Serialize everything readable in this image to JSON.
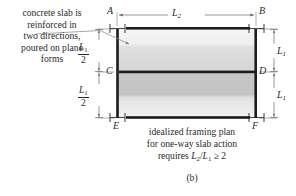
{
  "figure": {
    "panel_label": "(b)",
    "annotation_note": {
      "lines": [
        "concrete slab is",
        "reinforced in",
        "two directions,",
        "poured on plane",
        "forms"
      ]
    },
    "caption": {
      "line1": "idealized framing plan",
      "line2": "for one-way slab action",
      "line3_prefix": "requires ",
      "line3_expr_num": "L",
      "line3_expr_num_sub": "2",
      "line3_slash": "/",
      "line3_expr_den": "L",
      "line3_expr_den_sub": "1",
      "line3_suffix": " ≥ 2"
    },
    "corner_labels": {
      "top_left": "A",
      "top_right": "B",
      "mid_left": "C",
      "mid_right": "D",
      "bottom_left": "E",
      "bottom_right": "F"
    },
    "dimensions": {
      "span_top": {
        "symbol": "L",
        "subscript": "2"
      },
      "height_upper": {
        "symbol": "L",
        "subscript": "1"
      },
      "height_lower": {
        "symbol": "L",
        "subscript": "1"
      },
      "half_upper": {
        "numerator": "L",
        "numerator_sub": "1",
        "denominator": "2"
      },
      "half_lower": {
        "numerator": "L",
        "numerator_sub": "1",
        "denominator": "2"
      }
    },
    "colors": {
      "ink": "#2b2b2b",
      "beam": "#1c1c1c",
      "thin_line": "#6b6b6b",
      "slab_light": "#f0f0f0",
      "slab_mid": "#e0e0e0",
      "slab_dark": "#c9c9c9",
      "background": "#ffffff"
    }
  }
}
